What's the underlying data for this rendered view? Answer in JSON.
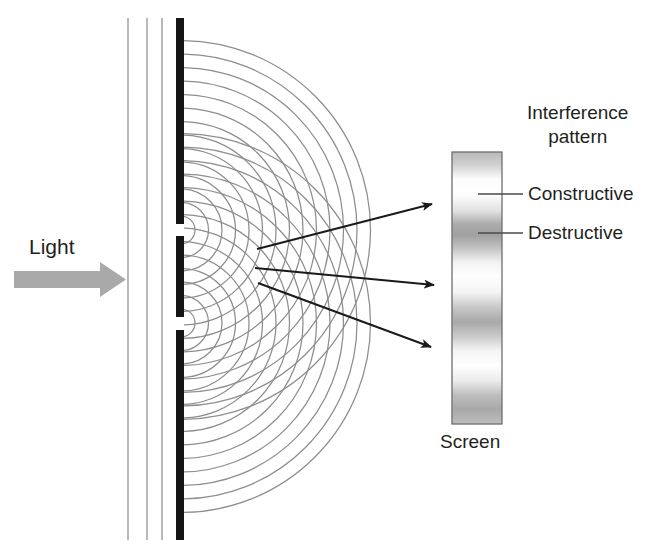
{
  "diagram": {
    "labels": {
      "light": "Light",
      "interference_title_line1": "Interference",
      "interference_title_line2": "pattern",
      "constructive": "Constructive",
      "destructive": "Destructive",
      "screen": "Screen"
    },
    "colors": {
      "background": "#ffffff",
      "text": "#231f20",
      "barrier": "#1a1a1a",
      "wavefront": "#808080",
      "wave_arc": "#8a8a8a",
      "arrow": "#1a1a1a",
      "light_arrow": "#a8a8a8",
      "leader_line": "#5a5a5a",
      "screen_border": "#6e6e6e",
      "fringe_dark": "#9a9a9a",
      "fringe_light": "#ffffff"
    },
    "incoming_wavefronts": {
      "count": 3,
      "x_positions": [
        128,
        147,
        162
      ],
      "y_top": 18,
      "y_bottom": 540
    },
    "barrier": {
      "x": 176,
      "width": 8,
      "y_top": 18,
      "y_bottom": 540,
      "slits": [
        {
          "name": "upper-slit",
          "y_top": 224,
          "y_bottom": 236
        },
        {
          "name": "lower-slit",
          "y_top": 317,
          "y_bottom": 330
        }
      ]
    },
    "wave_sources": [
      {
        "name": "upper-slit-source",
        "x": 181,
        "y": 230
      },
      {
        "name": "lower-slit-source",
        "x": 181,
        "y": 323
      }
    ],
    "wave_arcs": {
      "count_per_source": 14,
      "spacing_px": 13.5,
      "first_radius_px": 14,
      "max_radius_px": 190
    },
    "ray_arrows": [
      {
        "name": "ray-upper",
        "x1": 257,
        "y1": 249,
        "x2": 437,
        "y2": 203
      },
      {
        "name": "ray-middle",
        "x1": 255,
        "y1": 268,
        "x2": 440,
        "y2": 286
      },
      {
        "name": "ray-lower",
        "x1": 258,
        "y1": 283,
        "x2": 437,
        "y2": 349
      }
    ],
    "light_arrow": {
      "x1": 14,
      "y1": 279,
      "x2": 126,
      "y2": 279,
      "thickness": 17
    },
    "screen": {
      "x": 452,
      "y": 152,
      "width": 50,
      "height": 272,
      "fringes": [
        {
          "center_pct": 0,
          "type": "destructive"
        },
        {
          "center_pct": 14,
          "type": "constructive"
        },
        {
          "center_pct": 30,
          "type": "destructive"
        },
        {
          "center_pct": 46,
          "type": "constructive"
        },
        {
          "center_pct": 62,
          "type": "destructive"
        },
        {
          "center_pct": 78,
          "type": "constructive"
        },
        {
          "center_pct": 94,
          "type": "destructive"
        }
      ]
    },
    "leader_lines": [
      {
        "name": "leader-constructive",
        "x1": 478,
        "y1": 194,
        "x2": 522,
        "y2": 194
      },
      {
        "name": "leader-destructive",
        "x1": 478,
        "y1": 233,
        "x2": 522,
        "y2": 233
      }
    ]
  }
}
